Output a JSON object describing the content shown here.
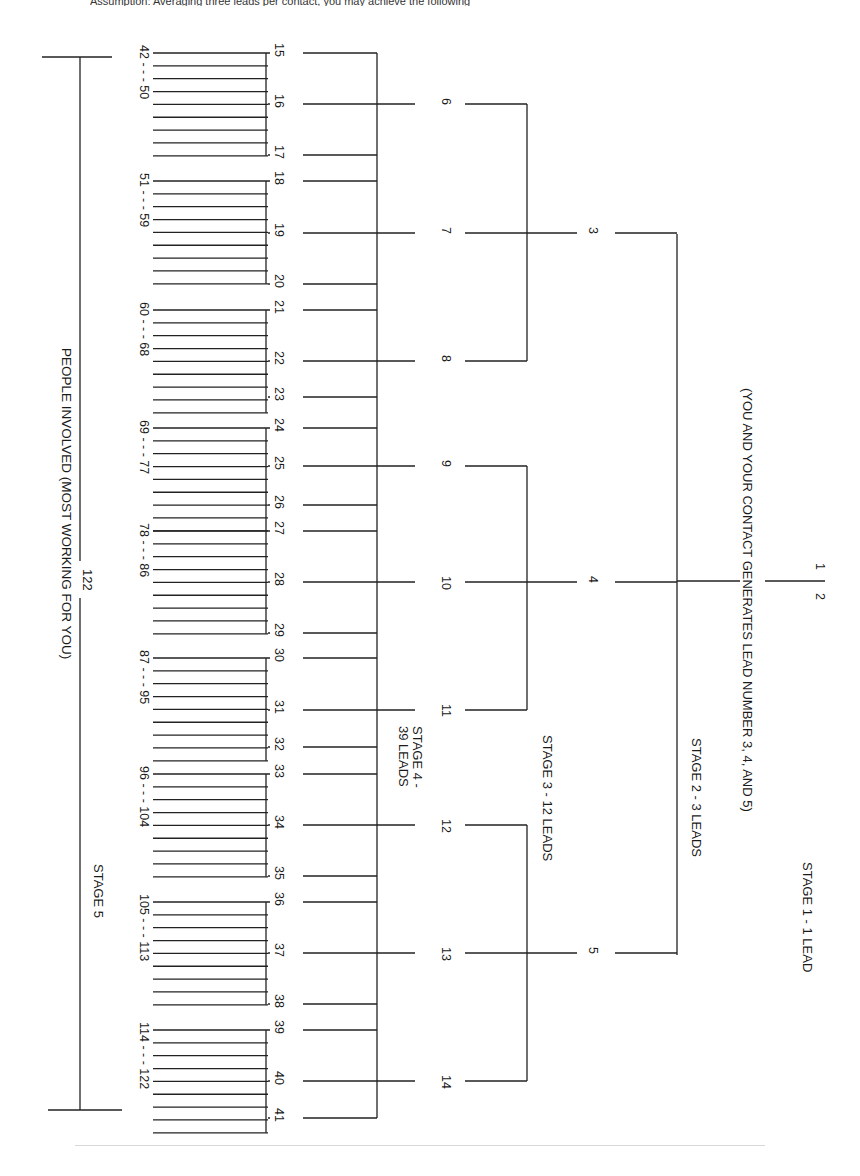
{
  "header": {
    "text": "Assumption: Averaging three leads per contact, you may achieve the following"
  },
  "stages": {
    "stage1": {
      "label": "STAGE 1 - 1 LEAD",
      "nodes": [
        "1",
        "2"
      ]
    },
    "stage1_note": "(YOU AND YOUR CONTACT GENERATES LEAD NUMBER 3, 4, AND 5)",
    "stage2": {
      "label": "STAGE 2 - 3 LEADS",
      "nodes": [
        "3",
        "4",
        "5"
      ]
    },
    "stage3": {
      "label": "STAGE 3 - 12 LEADS",
      "nodes": [
        "6",
        "7",
        "8",
        "9",
        "10",
        "11",
        "12",
        "13",
        "14"
      ]
    },
    "stage4": {
      "label_line1": "STAGE 4 -",
      "label_line2": "39 LEADS",
      "nodes": [
        "15",
        "16",
        "17",
        "18",
        "19",
        "20",
        "21",
        "22",
        "23",
        "24",
        "25",
        "26",
        "27",
        "28",
        "29",
        "30",
        "31",
        "32",
        "33",
        "34",
        "35",
        "36",
        "37",
        "38",
        "39",
        "40",
        "41"
      ]
    },
    "stage5": {
      "label": "STAGE 5",
      "range_labels": [
        "42 - - - 50",
        "51 - - - 59",
        "60 - - - 68",
        "69 - - - 77",
        "78 - - - 86",
        "87 - - - 95",
        "96 - - - 104",
        "105 - - - 113",
        "114 - - - 122"
      ]
    },
    "total": {
      "count": "122",
      "label": "PEOPLE INVOLVED (MOST WORKING FOR YOU)"
    }
  }
}
